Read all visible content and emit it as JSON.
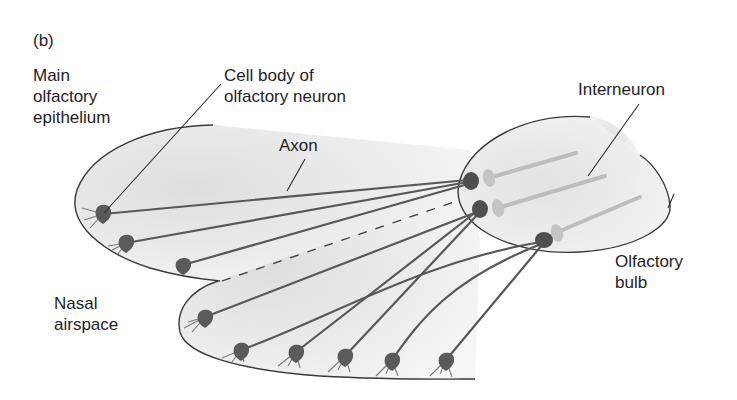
{
  "panel_label": "(b)",
  "labels": {
    "main_epithelium": "Main\nolfactory\nepithelium",
    "cell_body": "Cell body of\nolfactory neuron",
    "axon": "Axon",
    "interneuron": "Interneuron",
    "olfactory_bulb": "Olfactory\nbulb",
    "nasal_airspace": "Nasal\nairspace"
  },
  "colors": {
    "tissue_fill": "#e9e9e9",
    "outline": "#3a3a3a",
    "neuron": "#555555",
    "interneuron": "#bdbdbd",
    "leader": "#2a2a2a"
  },
  "neurons": [
    {
      "id": "n1",
      "x": 103,
      "y": 214,
      "target": "g1"
    },
    {
      "id": "n2",
      "x": 126,
      "y": 243,
      "target": "g1"
    },
    {
      "id": "n3",
      "x": 183,
      "y": 265,
      "target": "g1"
    },
    {
      "id": "n4",
      "x": 205,
      "y": 317,
      "target": "g2"
    },
    {
      "id": "n5",
      "x": 241,
      "y": 350,
      "target": "g3"
    },
    {
      "id": "n6",
      "x": 296,
      "y": 352,
      "target": "g2"
    },
    {
      "id": "n7",
      "x": 345,
      "y": 356,
      "target": "g2"
    },
    {
      "id": "n8",
      "x": 392,
      "y": 360,
      "target": "g3"
    },
    {
      "id": "n9",
      "x": 446,
      "y": 360,
      "target": "g3"
    }
  ],
  "glomeruli": [
    {
      "id": "g1",
      "x": 470,
      "y": 181
    },
    {
      "id": "g2",
      "x": 479,
      "y": 209
    },
    {
      "id": "g3",
      "x": 543,
      "y": 240
    }
  ],
  "interneurons": [
    {
      "x1": 488,
      "y1": 178,
      "x2": 576,
      "y2": 153
    },
    {
      "x1": 497,
      "y1": 209,
      "x2": 605,
      "y2": 176
    },
    {
      "x1": 556,
      "y1": 232,
      "x2": 640,
      "y2": 197
    }
  ]
}
